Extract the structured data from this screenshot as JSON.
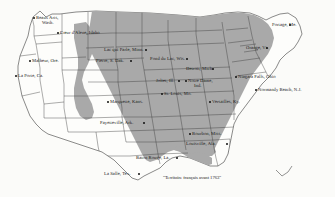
{
  "map": {
    "title": "Carte des toponymes français aux États-Unis",
    "legend": {
      "text": "\"Territoire français avant 1763\"",
      "swatch_color": "#a9a9a9"
    },
    "colors": {
      "french_territory_fill": "#a9a9a9",
      "other_states_fill": "#fdfdfb",
      "border_stroke": "#2b2b2b",
      "state_stroke": "#3a3a3a",
      "text": "#1a1a1a"
    },
    "places": [
      {
        "name": "place-beaux-arts",
        "label": "Beaux Arts,",
        "label2": "Wash.",
        "x": 36,
        "y": 15,
        "dot_x": 32.5,
        "dot_y": 17.0,
        "align": "left",
        "two_line": true
      },
      {
        "name": "place-coeur-dalene",
        "label": "Cœur d'Alene, Idaho",
        "label2": "",
        "x": 60,
        "y": 30,
        "dot_x": 57.0,
        "dot_y": 32.0,
        "align": "left",
        "two_line": false
      },
      {
        "name": "place-malheur",
        "label": "Malheur, Ore.",
        "label2": "",
        "x": 32,
        "y": 58,
        "dot_x": 28.5,
        "dot_y": 60.0,
        "align": "left",
        "two_line": false
      },
      {
        "name": "place-la-porte",
        "label": "La Porte, Ca.",
        "label2": "",
        "x": 18,
        "y": 73,
        "dot_x": 14.5,
        "dot_y": 75.0,
        "align": "left",
        "two_line": false
      },
      {
        "name": "place-lac-qui-parle",
        "label": "Lac qui Parle, Minn.",
        "label2": "",
        "x": 104,
        "y": 47,
        "dot_x": 145.0,
        "dot_y": 49.0,
        "align": "left",
        "two_line": false
      },
      {
        "name": "place-pierre",
        "label": "Pierre, S. Dak.",
        "label2": "",
        "x": 96,
        "y": 58,
        "dot_x": 130.0,
        "dot_y": 60.0,
        "align": "left",
        "two_line": false
      },
      {
        "name": "place-fond-du-lac",
        "label": "Fond du Lac, Wis.",
        "label2": "",
        "x": 150,
        "y": 56,
        "dot_x": 186.0,
        "dot_y": 58.0,
        "align": "left",
        "two_line": false
      },
      {
        "name": "place-detroit",
        "label": "Detroit, Mich.",
        "label2": "",
        "x": 186,
        "y": 66,
        "dot_x": 212.0,
        "dot_y": 68.0,
        "align": "left",
        "two_line": false
      },
      {
        "name": "place-joliet",
        "label": "Joliet, Ill.",
        "label2": "",
        "x": 156,
        "y": 78,
        "dot_x": 178.0,
        "dot_y": 80.0,
        "align": "left",
        "two_line": false
      },
      {
        "name": "place-notre-dame",
        "label": "Notre Dame,",
        "label2": "Ind.",
        "x": 188,
        "y": 78,
        "dot_x": 185.0,
        "dot_y": 80.0,
        "align": "left",
        "two_line": true
      },
      {
        "name": "place-st-louis",
        "label": "St. Louis, Mo.",
        "label2": "",
        "x": 164,
        "y": 91,
        "dot_x": 161.0,
        "dot_y": 93.0,
        "align": "left",
        "two_line": false
      },
      {
        "name": "place-marquette",
        "label": "Marquette, Kans.",
        "label2": "",
        "x": 110,
        "y": 99,
        "dot_x": 106.5,
        "dot_y": 101.0,
        "align": "left",
        "two_line": false
      },
      {
        "name": "place-versailles",
        "label": "Versailles, Ky.",
        "label2": "",
        "x": 212,
        "y": 99,
        "dot_x": 208.5,
        "dot_y": 101.0,
        "align": "left",
        "two_line": false
      },
      {
        "name": "place-niagara-falls",
        "label": "Niagara Falls, Ohio",
        "label2": "",
        "x": 238,
        "y": 74,
        "dot_x": 234.5,
        "dot_y": 76.0,
        "align": "left",
        "two_line": false
      },
      {
        "name": "place-normandy-beach",
        "label": "Normandy Beach, N.J.",
        "label2": "",
        "x": 258,
        "y": 87,
        "dot_x": 254.5,
        "dot_y": 89.0,
        "align": "left",
        "two_line": false
      },
      {
        "name": "place-orange",
        "label": "Orange, Vt.",
        "label2": "",
        "x": 246,
        "y": 45,
        "dot_x": 266.0,
        "dot_y": 47.0,
        "align": "left",
        "two_line": false
      },
      {
        "name": "place-portage",
        "label": "Portage, Me.",
        "label2": "",
        "x": 272,
        "y": 22,
        "dot_x": 289.0,
        "dot_y": 24.0,
        "align": "left",
        "two_line": false
      },
      {
        "name": "place-fayetteville",
        "label": "Fayetteville, Ark.",
        "label2": "",
        "x": 100,
        "y": 120,
        "dot_x": 143.0,
        "dot_y": 122.0,
        "align": "left",
        "two_line": false
      },
      {
        "name": "place-bourbon",
        "label": "Bourbon, Miss.",
        "label2": "",
        "x": 192,
        "y": 131,
        "dot_x": 188.5,
        "dot_y": 133.0,
        "align": "left",
        "two_line": false
      },
      {
        "name": "place-louisville",
        "label": "Louisville, Ala.",
        "label2": "",
        "x": 186,
        "y": 141,
        "dot_x": 226.0,
        "dot_y": 143.0,
        "align": "left",
        "two_line": false
      },
      {
        "name": "place-baton-rouge",
        "label": "Baton Rouge, La.",
        "label2": "",
        "x": 136,
        "y": 155,
        "dot_x": 176.0,
        "dot_y": 157.0,
        "align": "left",
        "two_line": false
      },
      {
        "name": "place-la-salle",
        "label": "La Salle, Tex.",
        "label2": "",
        "x": 104,
        "y": 171,
        "dot_x": 138.0,
        "dot_y": 172.5,
        "align": "left",
        "two_line": false
      }
    ]
  }
}
